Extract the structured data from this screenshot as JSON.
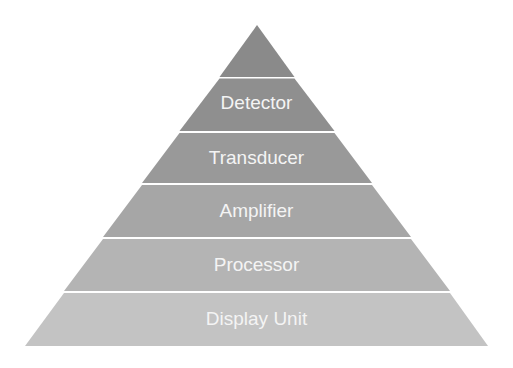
{
  "diagram": {
    "type": "pyramid",
    "apex": "blank",
    "tiers": [
      {
        "label": "Detector",
        "color": "#8f8f8f"
      },
      {
        "label": "Transducer",
        "color": "#999999"
      },
      {
        "label": "Amplifier",
        "color": "#a6a6a6"
      },
      {
        "label": "Processor",
        "color": "#b4b4b4"
      },
      {
        "label": "Display Unit",
        "color": "#c3c3c3"
      }
    ],
    "apex_color": "#8a8a8a",
    "separator_color": "#f2f2f2"
  }
}
